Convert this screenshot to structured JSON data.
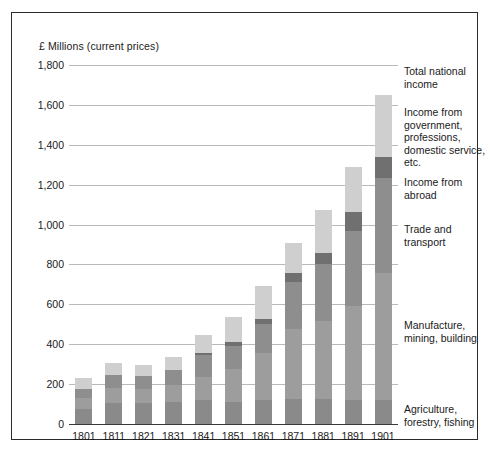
{
  "figure": {
    "axis_title": "£ Millions (current prices)",
    "border_color": "#2b2b2b",
    "background": "#ffffff"
  },
  "chart_data": {
    "type": "bar",
    "subtype": "stacked",
    "title": "£ Millions (current prices)",
    "xlabel": "",
    "ylabel": "£ Millions (current prices)",
    "ylim": [
      0,
      1800
    ],
    "ytick_step": 200,
    "grid": true,
    "legend_position": "right",
    "categories": [
      "1801",
      "1811",
      "1821",
      "1831",
      "1841",
      "1851",
      "1861",
      "1871",
      "1881",
      "1891",
      "1901"
    ],
    "ytick_labels": [
      "0",
      "200",
      "400",
      "600",
      "800",
      "1,000",
      "1,200",
      "1,400",
      "1,600",
      "1,800"
    ],
    "ytick_values": [
      0,
      200,
      400,
      600,
      800,
      1000,
      1200,
      1400,
      1600,
      1800
    ],
    "series": [
      {
        "name": "Agriculture, forestry, fishing",
        "color": "#8a8a8a",
        "values": [
          75,
          105,
          105,
          110,
          120,
          110,
          120,
          125,
          125,
          120,
          120
        ]
      },
      {
        "name": "Manufacture, mining, building",
        "color": "#9d9d9d",
        "values": [
          55,
          75,
          70,
          85,
          115,
          165,
          235,
          350,
          390,
          470,
          635
        ]
      },
      {
        "name": "Trade and transport",
        "color": "#8e8e8e",
        "values": [
          45,
          65,
          65,
          75,
          110,
          115,
          145,
          235,
          285,
          380,
          480
        ]
      },
      {
        "name": "Income from abroad",
        "color": "#707070",
        "values": [
          0,
          0,
          0,
          0,
          10,
          20,
          25,
          45,
          60,
          95,
          105
        ]
      },
      {
        "name": "Income from government, professions, domestic service, etc.",
        "color": "#cfcfcf",
        "values": [
          55,
          60,
          55,
          65,
          90,
          125,
          165,
          155,
          215,
          225,
          310
        ]
      }
    ],
    "totals": [
      230,
      305,
      295,
      335,
      445,
      535,
      690,
      910,
      1075,
      1290,
      1650
    ]
  },
  "legend": {
    "entries": [
      {
        "label": "Total national income",
        "top": 0
      },
      {
        "label": "Income from government, professions, domestic service, etc.",
        "top": 41
      },
      {
        "label": "Income from abroad",
        "top": 111
      },
      {
        "label": "Trade and transport",
        "top": 158
      },
      {
        "label": "Manufacture, mining, building",
        "top": 254
      },
      {
        "label": "Agriculture, forestry, fishing",
        "top": 338
      }
    ]
  }
}
